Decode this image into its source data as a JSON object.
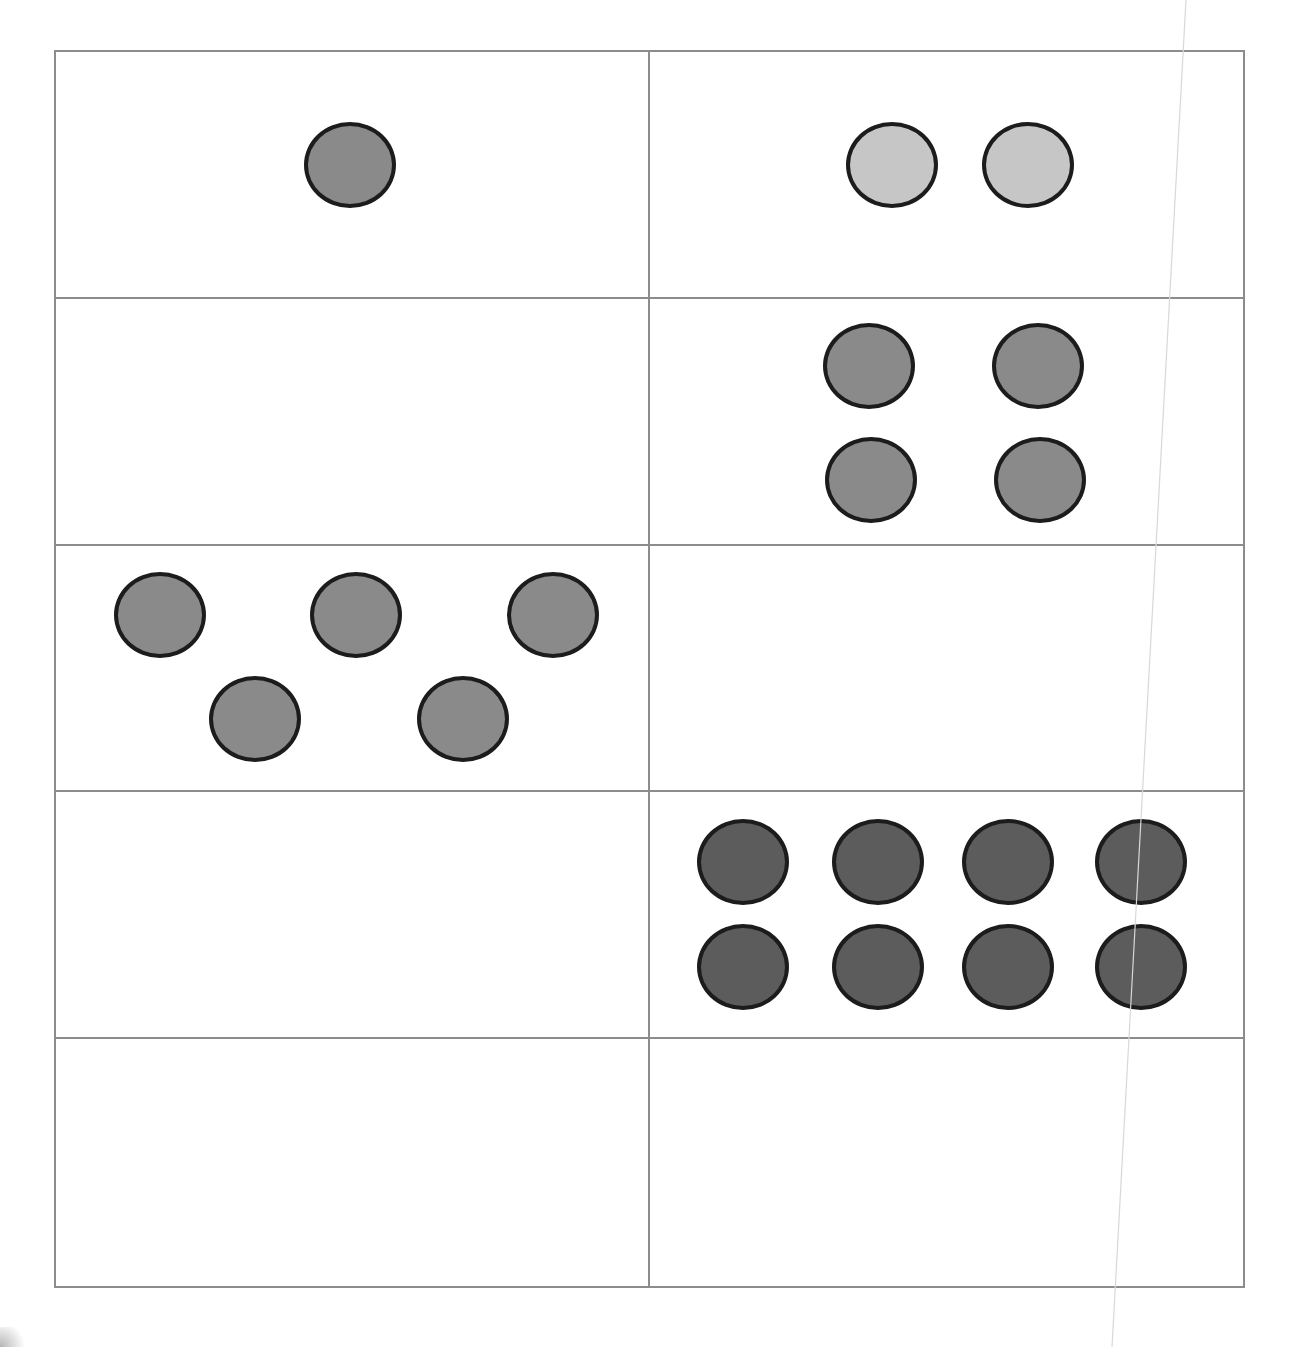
{
  "page": {
    "header_note": "Header text line clipped at top edge; only descender fragments visible",
    "colors": {
      "grid_line": "#8c8c8c",
      "counter_outline": "#1c1c1c",
      "counter_mid": "#8a8a8a",
      "counter_light": "#c6c6c6",
      "counter_dark": "#5c5c5c",
      "background": "#ffffff"
    }
  },
  "grid": {
    "rows": 5,
    "columns": 2,
    "cells": [
      {
        "row": 1,
        "col": 1,
        "count": 1,
        "tone": "mid",
        "counters": [
          {
            "x": 248,
            "y": 70
          }
        ]
      },
      {
        "row": 1,
        "col": 2,
        "count": 2,
        "tone": "light",
        "counters": [
          {
            "x": 196,
            "y": 70
          },
          {
            "x": 332,
            "y": 70
          }
        ]
      },
      {
        "row": 2,
        "col": 1,
        "count": 0,
        "tone": null,
        "counters": []
      },
      {
        "row": 2,
        "col": 2,
        "count": 4,
        "tone": "mid",
        "counters": [
          {
            "x": 173,
            "y": 24
          },
          {
            "x": 342,
            "y": 24
          },
          {
            "x": 175,
            "y": 138
          },
          {
            "x": 344,
            "y": 138
          }
        ]
      },
      {
        "row": 3,
        "col": 1,
        "count": 5,
        "tone": "mid",
        "counters": [
          {
            "x": 58,
            "y": 26
          },
          {
            "x": 254,
            "y": 26
          },
          {
            "x": 451,
            "y": 26
          },
          {
            "x": 153,
            "y": 130
          },
          {
            "x": 361,
            "y": 130
          }
        ]
      },
      {
        "row": 3,
        "col": 2,
        "count": 0,
        "tone": null,
        "counters": []
      },
      {
        "row": 4,
        "col": 1,
        "count": 0,
        "tone": null,
        "counters": []
      },
      {
        "row": 4,
        "col": 2,
        "count": 8,
        "tone": "dark",
        "counters": [
          {
            "x": 47,
            "y": 27
          },
          {
            "x": 182,
            "y": 27
          },
          {
            "x": 312,
            "y": 27
          },
          {
            "x": 445,
            "y": 27
          },
          {
            "x": 47,
            "y": 132
          },
          {
            "x": 182,
            "y": 132
          },
          {
            "x": 312,
            "y": 132
          },
          {
            "x": 445,
            "y": 132
          }
        ]
      },
      {
        "row": 5,
        "col": 1,
        "count": 0,
        "tone": null,
        "counters": []
      },
      {
        "row": 5,
        "col": 2,
        "count": 0,
        "tone": null,
        "counters": []
      }
    ]
  }
}
